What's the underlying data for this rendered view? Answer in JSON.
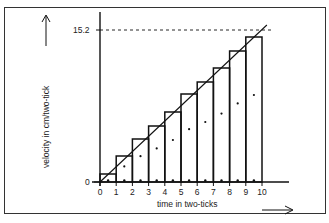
{
  "chart_data": {
    "type": "bar",
    "title": "",
    "xlabel": "time in two-ticks",
    "ylabel": "velocity in cm/two-tick",
    "x_ticks": [
      "0",
      "1",
      "2",
      "3",
      "4",
      "5",
      "6",
      "7",
      "8",
      "9",
      "10"
    ],
    "y_ticks": [
      "0",
      "15.2"
    ],
    "categories": [
      "0-1",
      "1-2",
      "2-3",
      "3-4",
      "4-5",
      "5-6",
      "6-7",
      "7-8",
      "8-9",
      "9-10"
    ],
    "values": [
      0.8,
      2.6,
      4.3,
      5.6,
      7.0,
      8.8,
      10.0,
      11.4,
      13.1,
      14.5
    ],
    "line": {
      "x": [
        0,
        10.3
      ],
      "y": [
        0,
        15.7
      ],
      "label": "best-fit straight line"
    },
    "reference_line": {
      "y": 15.2,
      "style": "dashed"
    },
    "ylim": [
      0,
      16.5
    ],
    "xlim": [
      0,
      10.6
    ],
    "grid": false,
    "legend": null
  },
  "labels": {
    "y_axis": "velocity in cm/two-tick",
    "x_axis": "time in two-ticks",
    "y_max": "15.2",
    "y_zero": "0"
  }
}
